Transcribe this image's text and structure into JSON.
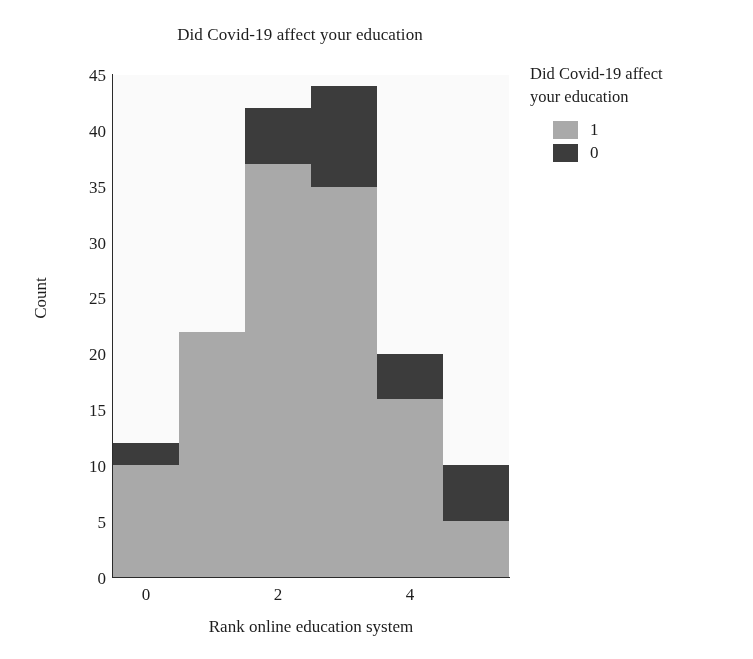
{
  "chart_data": {
    "type": "bar",
    "subtype": "stacked-histogram",
    "title": "Did Covid-19 affect your education",
    "xlabel": "Rank online education system",
    "ylabel": "Count",
    "categories": [
      "0",
      "1",
      "2",
      "3",
      "4",
      "5"
    ],
    "x": [
      0,
      1,
      2,
      3,
      4,
      5
    ],
    "xlim": [
      -0.5,
      5.5
    ],
    "ylim": [
      0,
      45
    ],
    "xticks": [
      0,
      2,
      4
    ],
    "xtick_labels": [
      "0",
      "2",
      "4"
    ],
    "yticks": [
      0,
      5,
      10,
      15,
      20,
      25,
      30,
      35,
      40,
      45
    ],
    "ytick_labels": [
      "0",
      "5",
      "10",
      "15",
      "20",
      "25",
      "30",
      "35",
      "40",
      "45"
    ],
    "grid": false,
    "legend_position": "right",
    "legend_title": "Did Covid-19 affect your education",
    "series": [
      {
        "name": "1",
        "color": "#a9a9a9",
        "values": [
          10,
          22,
          37,
          35,
          16,
          5
        ]
      },
      {
        "name": "0",
        "color": "#3b3b3b",
        "values": [
          2,
          0,
          5,
          9,
          4,
          5
        ]
      }
    ],
    "totals": [
      12,
      22,
      42,
      44,
      20,
      10
    ]
  },
  "legend": {
    "title_line1": "Did Covid-19 affect",
    "title_line2": "your education",
    "entries": [
      {
        "label": "1",
        "color": "#a9a9a9"
      },
      {
        "label": "0",
        "color": "#3b3b3b"
      }
    ]
  },
  "colors": {
    "series_1": "#a9a9a9",
    "series_0": "#3b3b3b",
    "axis": "#2a2a2a",
    "plot_background": "#fbfbfb",
    "text": "#1c1c1c"
  }
}
